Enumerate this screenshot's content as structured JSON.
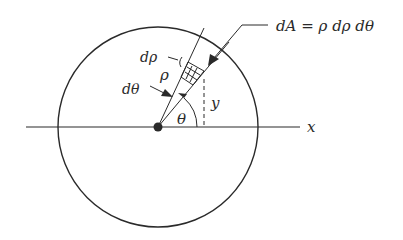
{
  "diagram": {
    "labels": {
      "dA_equation": "dA = ρ dρ dθ",
      "d_rho": "dρ",
      "rho": "ρ",
      "d_theta": "dθ",
      "theta": "θ",
      "y": "y",
      "x_axis": "x"
    },
    "colors": {
      "stroke": "#2a2a2a",
      "background": "#ffffff"
    }
  }
}
